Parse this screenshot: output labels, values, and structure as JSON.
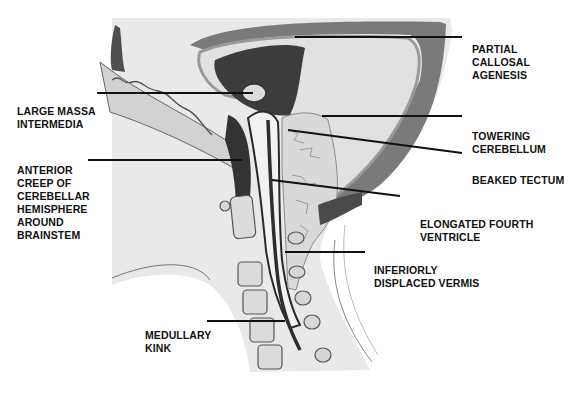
{
  "diagram": {
    "colors": {
      "background": "#ffffff",
      "skin": "#e6e6e6",
      "skull_dark": "#5c5c5c",
      "skull_mid": "#a8a8a8",
      "ventricle_dark": "#3a3a3a",
      "cerebellum": "#d6d6d6",
      "leader_line": "#111111",
      "label_text": "#111111"
    },
    "labels": [
      {
        "id": "partial-callosal-agenesis",
        "lines": [
          "PARTIAL",
          "CALLOSAL",
          "AGENESIS"
        ]
      },
      {
        "id": "large-massa-intermedia",
        "lines": [
          "LARGE MASSA",
          "INTERMEDIA"
        ]
      },
      {
        "id": "towering-cerebellum",
        "lines": [
          "TOWERING",
          "CEREBELLUM"
        ]
      },
      {
        "id": "anterior-creep",
        "lines": [
          "ANTERIOR",
          "CREEP OF",
          "CEREBELLAR",
          "HEMISPHERE",
          "AROUND",
          "BRAINSTEM"
        ]
      },
      {
        "id": "beaked-tectum",
        "lines": [
          "BEAKED TECTUM"
        ]
      },
      {
        "id": "elongated-fourth-ventricle",
        "lines": [
          "ELONGATED FOURTH",
          "VENTRICLE"
        ]
      },
      {
        "id": "inferiorly-displaced-vermis",
        "lines": [
          "INFERIORLY",
          "DISPLACED VERMIS"
        ]
      },
      {
        "id": "medullary-kink",
        "lines": [
          "MEDULLARY",
          "KINK"
        ]
      }
    ]
  }
}
